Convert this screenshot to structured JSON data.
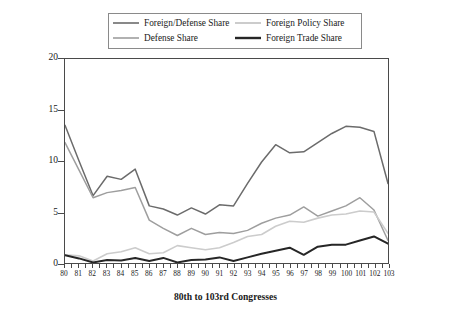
{
  "chart_data": {
    "type": "line",
    "title": "",
    "xlabel": "80th to 103rd Congresses",
    "ylabel": "Percentage of All Hearings",
    "xlim": [
      80,
      103
    ],
    "ylim": [
      0,
      20
    ],
    "grid": false,
    "legend_position": "top-center",
    "x": [
      80,
      81,
      82,
      83,
      84,
      85,
      86,
      87,
      88,
      89,
      90,
      91,
      92,
      93,
      94,
      95,
      96,
      97,
      98,
      99,
      100,
      101,
      102,
      103
    ],
    "xtick_labels": [
      "80",
      "81",
      "82",
      "83",
      "84",
      "85",
      "86",
      "87",
      "88",
      "89",
      "90",
      "91",
      "92",
      "93",
      "94",
      "95",
      "96",
      "97",
      "98",
      "99",
      "100",
      "101",
      "102",
      "103"
    ],
    "ytick_labels": [
      "0",
      "5",
      "10",
      "15",
      "20"
    ],
    "ytick_values": [
      0,
      5,
      10,
      15,
      20
    ],
    "series": [
      {
        "name": "Foreign/Defense Share",
        "color": "#6b6b6b",
        "width": 1.5,
        "values": [
          13.5,
          10.0,
          6.6,
          8.5,
          8.2,
          9.2,
          5.6,
          5.3,
          4.7,
          5.4,
          4.8,
          5.7,
          5.6,
          7.8,
          9.9,
          11.6,
          10.8,
          10.9,
          11.8,
          12.7,
          13.4,
          13.3,
          12.9,
          7.8
        ]
      },
      {
        "name": "Defense Share",
        "color": "#9e9e9e",
        "width": 1.5,
        "values": [
          11.8,
          9.1,
          6.4,
          6.9,
          7.1,
          7.4,
          4.2,
          3.4,
          2.7,
          3.4,
          2.8,
          3.0,
          2.9,
          3.2,
          3.9,
          4.4,
          4.7,
          5.5,
          4.6,
          5.1,
          5.6,
          6.4,
          5.2,
          2.2
        ]
      },
      {
        "name": "Foreign Policy Share",
        "color": "#cccccc",
        "width": 1.6,
        "values": [
          0.8,
          0.7,
          0.2,
          0.9,
          1.1,
          1.5,
          0.9,
          1.0,
          1.7,
          1.5,
          1.3,
          1.5,
          2.0,
          2.6,
          2.8,
          3.6,
          4.1,
          4.0,
          4.4,
          4.7,
          4.8,
          5.1,
          5.0,
          2.9
        ]
      },
      {
        "name": "Foreign Trade Share",
        "color": "#262626",
        "width": 2.0,
        "values": [
          0.75,
          0.45,
          0.05,
          0.3,
          0.25,
          0.5,
          0.2,
          0.5,
          0.05,
          0.3,
          0.35,
          0.55,
          0.2,
          0.55,
          0.9,
          1.2,
          1.5,
          0.8,
          1.6,
          1.8,
          1.8,
          2.2,
          2.6,
          1.9
        ]
      }
    ]
  }
}
